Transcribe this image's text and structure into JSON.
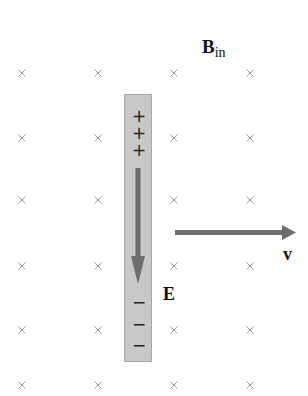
{
  "diagram": {
    "field_label": {
      "main": "B",
      "subscript": "in"
    },
    "velocity_label": "v",
    "efield_label": "E",
    "cross_symbol": "×",
    "positive_charges": [
      "+",
      "+",
      "+"
    ],
    "negative_charges": [
      "−",
      "−",
      "−"
    ],
    "cross_grid": {
      "columns_x": [
        22,
        98,
        174,
        250
      ],
      "rows_y": [
        73,
        138,
        200,
        266,
        330,
        385
      ]
    },
    "colors": {
      "rod_fill": "#c8c8c8",
      "arrow": "#6e6e6e",
      "cross": "#9a9a9a",
      "text": "#111111"
    }
  }
}
